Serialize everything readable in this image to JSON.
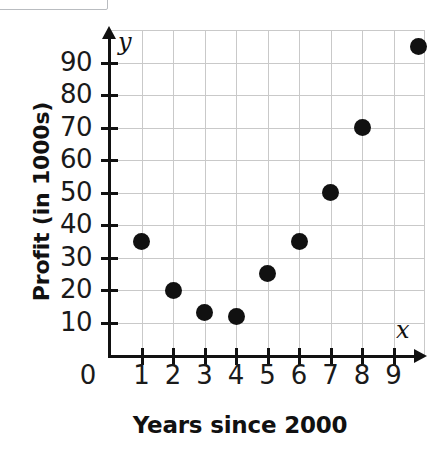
{
  "figure": {
    "y_axis_title": "Profit (in 1000s)",
    "x_axis_title": "Years since 2000",
    "y_variable": "y",
    "x_variable": "x",
    "origin_label": "0"
  },
  "chart_data": {
    "type": "scatter",
    "title": "",
    "xlabel": "Years since 2000",
    "ylabel": "Profit (in 1000s)",
    "xlim": [
      0,
      10
    ],
    "ylim": [
      0,
      100
    ],
    "grid": true,
    "legend": null,
    "x_ticks": [
      1,
      2,
      3,
      4,
      5,
      6,
      7,
      8,
      9
    ],
    "x_tick_labels": [
      "1",
      "2",
      "3",
      "4",
      "5",
      "6",
      "7",
      "8",
      "9"
    ],
    "y_ticks": [
      10,
      20,
      30,
      40,
      50,
      60,
      70,
      80,
      90
    ],
    "y_tick_labels": [
      "10",
      "20",
      "30",
      "40",
      "50",
      "60",
      "70",
      "80",
      "90"
    ],
    "points": [
      {
        "x": 1,
        "y": 35
      },
      {
        "x": 2,
        "y": 20
      },
      {
        "x": 3,
        "y": 13
      },
      {
        "x": 4,
        "y": 12
      },
      {
        "x": 5,
        "y": 25
      },
      {
        "x": 6,
        "y": 35
      },
      {
        "x": 7,
        "y": 50
      },
      {
        "x": 8,
        "y": 70
      },
      {
        "x": 9.8,
        "y": 95
      }
    ],
    "marker_color": "#111111",
    "grid_color": "#c9c9c9",
    "axis_color": "#111111"
  }
}
